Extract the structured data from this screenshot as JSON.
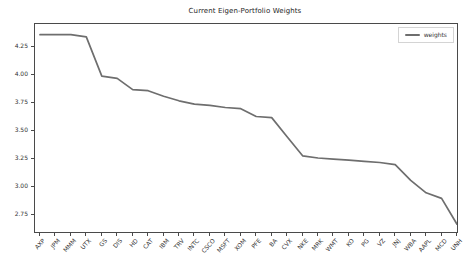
{
  "figure": {
    "background": "#ffffff",
    "frame_color": "#4a4a4a",
    "text_color": "#333333"
  },
  "chart_data": {
    "type": "line",
    "title": "Current Eigen-Portfolio Weights",
    "xlabel": "",
    "ylabel": "",
    "grid": false,
    "legend": {
      "label": "weights",
      "position": "upper right"
    },
    "ylim": [
      2.6,
      4.455
    ],
    "yticks": [
      2.75,
      3.0,
      3.25,
      3.5,
      3.75,
      4.0,
      4.25
    ],
    "categories": [
      "AXP",
      "JPM",
      "MMM",
      "UTX",
      "GS",
      "DIS",
      "HD",
      "CAT",
      "IBM",
      "TRV",
      "INTC",
      "CSCO",
      "MSFT",
      "XOM",
      "PFE",
      "BA",
      "CVX",
      "NKE",
      "MRK",
      "WMT",
      "KO",
      "PG",
      "VZ",
      "JNJ",
      "WBA",
      "AAPL",
      "MCD",
      "UNH"
    ],
    "series": [
      {
        "name": "weights",
        "color": "#6e6e6e",
        "values": [
          4.36,
          4.36,
          4.36,
          4.34,
          3.99,
          3.97,
          3.87,
          3.86,
          3.81,
          3.77,
          3.74,
          3.73,
          3.71,
          3.7,
          3.63,
          3.62,
          3.45,
          3.28,
          3.26,
          3.25,
          3.24,
          3.23,
          3.22,
          3.2,
          3.06,
          2.95,
          2.9,
          2.67
        ]
      }
    ]
  }
}
